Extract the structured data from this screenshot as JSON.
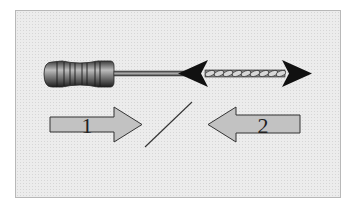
{
  "diagram": {
    "instrument": {
      "handle": "ribbed-handle",
      "shaft": "file-shaft",
      "working_part": "twisted-spiral-flutes",
      "motion_indicator": "double-headed-arrow"
    },
    "arrows": [
      {
        "label": "1",
        "direction": "right"
      },
      {
        "label": "2",
        "direction": "left"
      }
    ],
    "separator": "diagonal-line",
    "colors": {
      "background": "#ececec",
      "frame_border": "#b8b8b8",
      "arrow_fill": "#c2c2c2",
      "arrow_stroke": "#333333",
      "motion_arrow": "#111111"
    }
  }
}
